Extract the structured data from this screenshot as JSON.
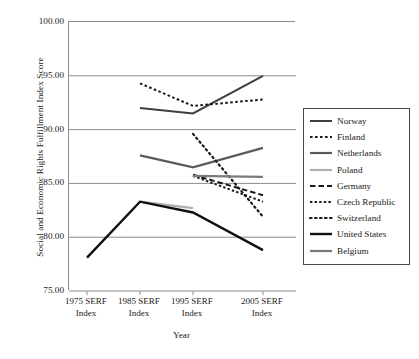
{
  "chart_data": {
    "type": "line",
    "title": "",
    "xlabel": "Year",
    "ylabel": "Social and Economic Rights Fulfillment Index Score",
    "categories": [
      "1975 SERF Index",
      "1985 SERF Index",
      "1995 SERF Index",
      "2005 SERF Index"
    ],
    "ylim": [
      75.0,
      100.0
    ],
    "yticks": [
      "100.00",
      "95.00",
      "90.00",
      "85.00",
      "80.00",
      "75.00"
    ],
    "ytick_values": [
      100.0,
      95.0,
      90.0,
      85.0,
      80.0,
      75.0
    ],
    "grid": "horizontal",
    "legend_position": "right",
    "series": [
      {
        "name": "Norway",
        "color": "#3f3f3f",
        "style": "solid",
        "width": 2.0,
        "x": [
          1,
          2,
          3
        ],
        "values": [
          92.0,
          91.5,
          95.0
        ]
      },
      {
        "name": "Finland",
        "color": "#1a1a1a",
        "style": "dashed-fine",
        "width": 2.0,
        "x": [
          1,
          2,
          3
        ],
        "values": [
          94.3,
          92.2,
          92.8
        ]
      },
      {
        "name": "Netherlands",
        "color": "#5a5a5a",
        "style": "solid",
        "width": 2.2,
        "x": [
          1,
          2,
          3
        ],
        "values": [
          87.6,
          86.5,
          88.3
        ]
      },
      {
        "name": "Poland",
        "color": "#b0b0b0",
        "style": "solid",
        "width": 2.2,
        "x": [
          1,
          2
        ],
        "values": [
          83.3,
          82.7
        ]
      },
      {
        "name": "Germany",
        "color": "#1a1a1a",
        "style": "dash-long",
        "width": 2.0,
        "x": [
          2,
          3
        ],
        "values": [
          85.8,
          83.9
        ]
      },
      {
        "name": "Czech Republic",
        "color": "#1a1a1a",
        "style": "dash-short",
        "width": 2.0,
        "x": [
          2,
          3
        ],
        "values": [
          85.7,
          83.3
        ]
      },
      {
        "name": "Switzerland",
        "color": "#1a1a1a",
        "style": "dotted",
        "width": 2.2,
        "x": [
          2,
          3
        ],
        "values": [
          89.6,
          81.9
        ]
      },
      {
        "name": "United States",
        "color": "#111111",
        "style": "solid",
        "width": 2.4,
        "x": [
          0,
          1,
          2,
          3
        ],
        "values": [
          78.1,
          83.3,
          82.3,
          78.8
        ]
      },
      {
        "name": "Belgium",
        "color": "#7a7a7a",
        "style": "solid",
        "width": 2.2,
        "x": [
          2,
          3
        ],
        "values": [
          85.7,
          85.6
        ]
      }
    ]
  },
  "legend": {
    "entries": [
      {
        "label": "Norway"
      },
      {
        "label": "Finland"
      },
      {
        "label": "Netherlands"
      },
      {
        "label": "Poland"
      },
      {
        "label": "Germany"
      },
      {
        "label": "Czech Republic"
      },
      {
        "label": "Switzerland"
      },
      {
        "label": "United States"
      },
      {
        "label": "Belgium"
      }
    ]
  }
}
